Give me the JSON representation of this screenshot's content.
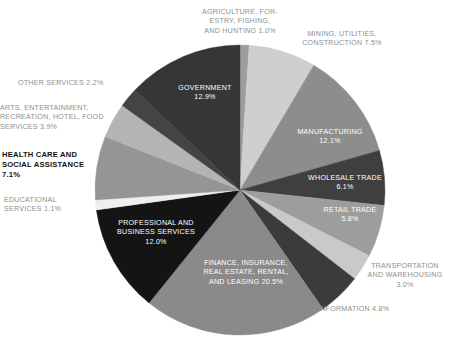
{
  "chart_data": {
    "type": "pie",
    "title": "",
    "subtitle": "",
    "xlabel": "",
    "ylabel": "",
    "legend_position": "none",
    "grid": false,
    "units": "percent",
    "start_angle_deg": 0,
    "direction": "clockwise",
    "categories": [
      "AGRICULTURE, FORESTRY, FISHING, AND HUNTING",
      "MINING, UTILITIES, CONSTRUCTION",
      "MANUFACTURING",
      "WHOLESALE TRADE",
      "RETAIL TRADE",
      "TRANSPORTATION AND WAREHOUSING",
      "INFORMATION",
      "FINANCE, INSURANCE, REAL ESTATE, RENTAL, AND LEASING",
      "PROFESSIONAL AND BUSINESS SERVICES",
      "EDUCATIONAL SERVICES",
      "HEALTH CARE AND SOCIAL ASSISTANCE",
      "ARTS, ENTERTAINMENT, RECREATION, HOTEL, FOOD SERVICES",
      "OTHER SERVICES",
      "GOVERNMENT"
    ],
    "values": [
      1.0,
      7.5,
      12.1,
      6.1,
      5.8,
      3.0,
      4.8,
      20.5,
      12.0,
      1.1,
      7.1,
      3.9,
      2.2,
      12.9
    ],
    "colors": [
      "#9d9d9d",
      "#cfcfcf",
      "#8d8d8d",
      "#3f3f3f",
      "#9d9d9d",
      "#c9c9c9",
      "#3b3b3b",
      "#8a8a8a",
      "#141414",
      "#efefef",
      "#959595",
      "#b4b4b4",
      "#444444",
      "#363636"
    ]
  },
  "slices": [
    {
      "id": "agriculture",
      "name": "AGRICULTURE, FORESTRY, FISHING, AND HUNTING",
      "value": 1.0,
      "color": "#9d9d9d",
      "label_text": "AGRICULTURE, FOR-\nESTRY, FISHING,\nAND HUNTING 1.0%",
      "label_placement": "outside"
    },
    {
      "id": "mining-utilities-construction",
      "name": "MINING, UTILITIES, CONSTRUCTION",
      "value": 7.5,
      "color": "#cfcfcf",
      "label_text": "MINING, UTILITIES,\nCONSTRUCTION 7.5%",
      "label_placement": "outside"
    },
    {
      "id": "manufacturing",
      "name": "MANUFACTURING",
      "value": 12.1,
      "color": "#8d8d8d",
      "label_text": "MANUFACTURING\n12.1%",
      "label_placement": "inside"
    },
    {
      "id": "wholesale-trade",
      "name": "WHOLESALE TRADE",
      "value": 6.1,
      "color": "#3f3f3f",
      "label_text": "WHOLESALE TRADE\n6.1%",
      "label_placement": "inside"
    },
    {
      "id": "retail-trade",
      "name": "RETAIL TRADE",
      "value": 5.8,
      "color": "#9d9d9d",
      "label_text": "RETAIL TRADE\n5.8%",
      "label_placement": "inside"
    },
    {
      "id": "transportation-warehousing",
      "name": "TRANSPORTATION AND WAREHOUSING",
      "value": 3.0,
      "color": "#c9c9c9",
      "label_text": "TRANSPORTATION\nAND WAREHOUSING\n3.0%",
      "label_placement": "outside"
    },
    {
      "id": "information",
      "name": "INFORMATION",
      "value": 4.8,
      "color": "#3b3b3b",
      "label_text": "INFORMATION 4.8%",
      "label_placement": "outside"
    },
    {
      "id": "finance-insurance-real-estate",
      "name": "FINANCE, INSURANCE, REAL ESTATE, RENTAL, AND LEASING",
      "value": 20.5,
      "color": "#8a8a8a",
      "label_text": "FINANCE, INSURANCE,\nREAL ESTATE, RENTAL,\nAND LEASING 20.5%",
      "label_placement": "inside"
    },
    {
      "id": "professional-business-services",
      "name": "PROFESSIONAL AND BUSINESS SERVICES",
      "value": 12.0,
      "color": "#141414",
      "label_text": "PROFESSIONAL AND\nBUSINESS SERVICES\n12.0%",
      "label_placement": "inside"
    },
    {
      "id": "educational-services",
      "name": "EDUCATIONAL SERVICES",
      "value": 1.1,
      "color": "#efefef",
      "label_text": "EDUCATIONAL\nSERVICES 1.1%",
      "label_placement": "outside"
    },
    {
      "id": "health-care-social-assistance",
      "name": "HEALTH CARE AND SOCIAL ASSISTANCE",
      "value": 7.1,
      "color": "#959595",
      "label_text": "HEALTH CARE AND\nSOCIAL ASSISTANCE\n7.1%",
      "label_placement": "outside",
      "emphasis": true
    },
    {
      "id": "arts-entertainment-recreation",
      "name": "ARTS, ENTERTAINMENT, RECREATION, HOTEL, FOOD SERVICES",
      "value": 3.9,
      "color": "#b4b4b4",
      "label_text": "ARTS, ENTERTAINMENT,\nRECREATION, HOTEL, FOOD\nSERVICES 3.9%",
      "label_placement": "outside"
    },
    {
      "id": "other-services",
      "name": "OTHER SERVICES",
      "value": 2.2,
      "color": "#444444",
      "label_text": "OTHER SERVICES 2.2%",
      "label_placement": "outside"
    },
    {
      "id": "government",
      "name": "GOVERNMENT",
      "value": 12.9,
      "color": "#363636",
      "label_text": "GOVERNMENT\n12.9%",
      "label_placement": "inside"
    }
  ]
}
